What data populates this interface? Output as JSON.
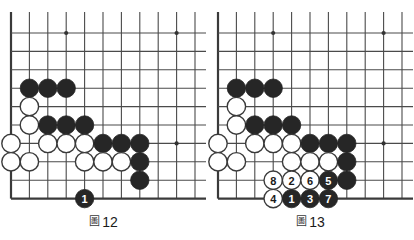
{
  "page": {
    "type": "go-game-diagram-pair",
    "background": "#ffffff"
  },
  "style": {
    "line_color": "#4a4a4a",
    "border_color": "#3a3a3a",
    "black_stone": "#262626",
    "white_stone": "#ffffff",
    "white_stone_border": "#3a3a3a",
    "star_point": "#333333",
    "label_on_black": "#ffffff",
    "label_on_white": "#1a1a1a"
  },
  "geometry": {
    "origin_x": 11,
    "origin_y": 33,
    "spacing": 18.4,
    "cols": 11,
    "rows": 10,
    "stone_radius": 9.2,
    "board2_offset_x": 214
  },
  "figures": [
    {
      "id": "figure-12",
      "caption_kanji": "圖",
      "caption_number": "12",
      "star_points": [
        {
          "col": 3,
          "row": 0
        },
        {
          "col": 9,
          "row": 0
        },
        {
          "col": 9,
          "row": 6
        }
      ],
      "stones": [
        {
          "col": 1,
          "row": 3,
          "color": "black",
          "label": ""
        },
        {
          "col": 2,
          "row": 3,
          "color": "black",
          "label": ""
        },
        {
          "col": 3,
          "row": 3,
          "color": "black",
          "label": ""
        },
        {
          "col": 1,
          "row": 4,
          "color": "white",
          "label": ""
        },
        {
          "col": 1,
          "row": 5,
          "color": "white",
          "label": ""
        },
        {
          "col": 2,
          "row": 5,
          "color": "black",
          "label": ""
        },
        {
          "col": 3,
          "row": 5,
          "color": "black",
          "label": ""
        },
        {
          "col": 4,
          "row": 5,
          "color": "black",
          "label": ""
        },
        {
          "col": 0,
          "row": 6,
          "color": "white",
          "label": ""
        },
        {
          "col": 2,
          "row": 6,
          "color": "white",
          "label": ""
        },
        {
          "col": 3,
          "row": 6,
          "color": "white",
          "label": ""
        },
        {
          "col": 4,
          "row": 6,
          "color": "white",
          "label": ""
        },
        {
          "col": 5,
          "row": 6,
          "color": "black",
          "label": ""
        },
        {
          "col": 6,
          "row": 6,
          "color": "black",
          "label": ""
        },
        {
          "col": 7,
          "row": 6,
          "color": "black",
          "label": ""
        },
        {
          "col": 0,
          "row": 7,
          "color": "white",
          "label": ""
        },
        {
          "col": 1,
          "row": 7,
          "color": "white",
          "label": ""
        },
        {
          "col": 4,
          "row": 7,
          "color": "white",
          "label": ""
        },
        {
          "col": 5,
          "row": 7,
          "color": "white",
          "label": ""
        },
        {
          "col": 6,
          "row": 7,
          "color": "white",
          "label": ""
        },
        {
          "col": 7,
          "row": 7,
          "color": "black",
          "label": ""
        },
        {
          "col": 7,
          "row": 8,
          "color": "black",
          "label": ""
        },
        {
          "col": 4,
          "row": 9,
          "color": "black",
          "label": "1"
        }
      ]
    },
    {
      "id": "figure-13",
      "caption_kanji": "圖",
      "caption_number": "13",
      "star_points": [
        {
          "col": 3,
          "row": 0
        },
        {
          "col": 9,
          "row": 0
        },
        {
          "col": 9,
          "row": 6
        }
      ],
      "stones": [
        {
          "col": 1,
          "row": 3,
          "color": "black",
          "label": ""
        },
        {
          "col": 2,
          "row": 3,
          "color": "black",
          "label": ""
        },
        {
          "col": 3,
          "row": 3,
          "color": "black",
          "label": ""
        },
        {
          "col": 1,
          "row": 4,
          "color": "white",
          "label": ""
        },
        {
          "col": 1,
          "row": 5,
          "color": "white",
          "label": ""
        },
        {
          "col": 2,
          "row": 5,
          "color": "black",
          "label": ""
        },
        {
          "col": 3,
          "row": 5,
          "color": "black",
          "label": ""
        },
        {
          "col": 4,
          "row": 5,
          "color": "black",
          "label": ""
        },
        {
          "col": 0,
          "row": 6,
          "color": "white",
          "label": ""
        },
        {
          "col": 2,
          "row": 6,
          "color": "white",
          "label": ""
        },
        {
          "col": 3,
          "row": 6,
          "color": "white",
          "label": ""
        },
        {
          "col": 4,
          "row": 6,
          "color": "white",
          "label": ""
        },
        {
          "col": 5,
          "row": 6,
          "color": "black",
          "label": ""
        },
        {
          "col": 6,
          "row": 6,
          "color": "black",
          "label": ""
        },
        {
          "col": 7,
          "row": 6,
          "color": "black",
          "label": ""
        },
        {
          "col": 0,
          "row": 7,
          "color": "white",
          "label": ""
        },
        {
          "col": 1,
          "row": 7,
          "color": "white",
          "label": ""
        },
        {
          "col": 4,
          "row": 7,
          "color": "white",
          "label": ""
        },
        {
          "col": 5,
          "row": 7,
          "color": "white",
          "label": ""
        },
        {
          "col": 6,
          "row": 7,
          "color": "white",
          "label": ""
        },
        {
          "col": 7,
          "row": 7,
          "color": "black",
          "label": ""
        },
        {
          "col": 7,
          "row": 8,
          "color": "black",
          "label": ""
        },
        {
          "col": 3,
          "row": 8,
          "color": "white",
          "label": "8"
        },
        {
          "col": 4,
          "row": 8,
          "color": "white",
          "label": "2"
        },
        {
          "col": 5,
          "row": 8,
          "color": "white",
          "label": "6"
        },
        {
          "col": 6,
          "row": 8,
          "color": "black",
          "label": "5"
        },
        {
          "col": 3,
          "row": 9,
          "color": "white",
          "label": "4"
        },
        {
          "col": 4,
          "row": 9,
          "color": "black",
          "label": "1"
        },
        {
          "col": 5,
          "row": 9,
          "color": "black",
          "label": "3"
        },
        {
          "col": 6,
          "row": 9,
          "color": "black",
          "label": "7"
        }
      ]
    }
  ]
}
